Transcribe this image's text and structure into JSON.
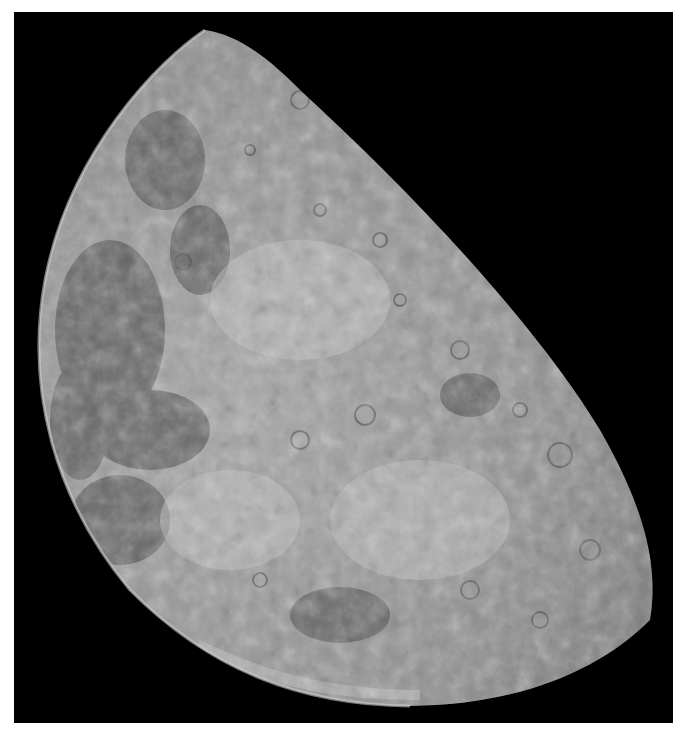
{
  "image": {
    "subject": "Moon (gibbous phase, photographed from orbit)",
    "background_color": "#000000",
    "margin_color": "#ffffff",
    "surface_colors": {
      "highlands": "#a8a8a8",
      "mare": "#5e5e5e",
      "limb_bright": "#c8c8c8"
    }
  }
}
